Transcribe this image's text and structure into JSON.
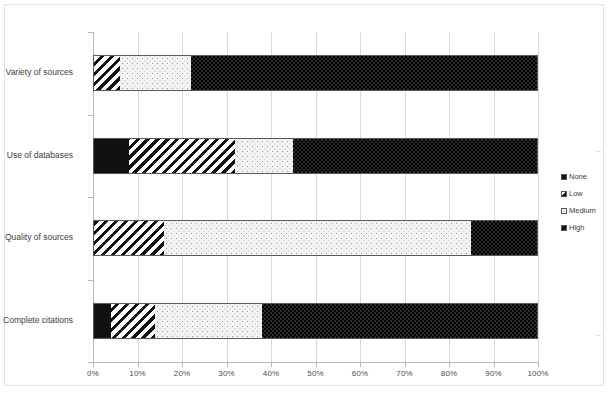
{
  "chart_data": {
    "type": "bar",
    "orientation": "horizontal",
    "stacked": true,
    "normalized": "percent",
    "title": "",
    "xlabel": "",
    "ylabel": "",
    "xlim": [
      0,
      100
    ],
    "grid": true,
    "legend_position": "right",
    "x_tick_labels": [
      "0%",
      "10%",
      "20%",
      "30%",
      "40%",
      "50%",
      "60%",
      "70%",
      "80%",
      "90%",
      "100%"
    ],
    "x_tick_values": [
      0,
      10,
      20,
      30,
      40,
      50,
      60,
      70,
      80,
      90,
      100
    ],
    "categories": [
      "Variety of sources",
      "Use of databases",
      "Quality of sources",
      "Complete citations"
    ],
    "series": [
      {
        "name": "None",
        "values": [
          0,
          8,
          0,
          4
        ]
      },
      {
        "name": "Low",
        "values": [
          6,
          24,
          16,
          10
        ]
      },
      {
        "name": "Medium",
        "values": [
          16,
          13,
          69,
          24
        ]
      },
      {
        "name": "High",
        "values": [
          78,
          55,
          15,
          62
        ]
      }
    ],
    "legend": [
      {
        "label": "None",
        "pattern": "solid-black"
      },
      {
        "label": "Low",
        "pattern": "diagonal-hatch"
      },
      {
        "label": "Medium",
        "pattern": "light-dots"
      },
      {
        "label": "High",
        "pattern": "dark-checker"
      }
    ],
    "colors": {
      "none": "#111111",
      "low": "#ffffff",
      "medium": "#f3f3f3",
      "high": "#2b2b2b",
      "gridline": "#d9d9d9",
      "axis": "#b7b7b7",
      "text": "#3d3d3d",
      "border": "#e3e3e3"
    }
  }
}
